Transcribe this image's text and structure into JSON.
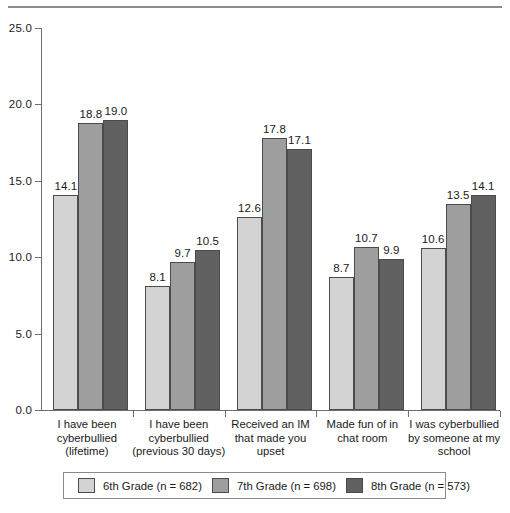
{
  "figure": {
    "top_rule": "horizontal-rule",
    "background_color": "#ffffff"
  },
  "chart_data": {
    "type": "bar",
    "title": "",
    "subtitle": "",
    "xlabel": "",
    "ylabel": "",
    "ylim": [
      0.0,
      25.0
    ],
    "ytick_labels": [
      "0.0",
      "5.0",
      "10.0",
      "15.0",
      "20.0",
      "25.0"
    ],
    "ytick_values": [
      0.0,
      5.0,
      10.0,
      15.0,
      20.0,
      25.0
    ],
    "grid": false,
    "legend_position": "bottom",
    "categories": [
      "I have been\ncyberbullied\n(lifetime)",
      "I have been\ncyberbullied\n(previous 30 days)",
      "Received an IM\nthat made you\nupset",
      "Made fun of in\nchat room",
      "I was cyberbullied\nby someone at my\nschool"
    ],
    "category_lines": [
      [
        "I have been",
        "cyberbullied",
        "(lifetime)"
      ],
      [
        "I have been",
        "cyberbullied",
        "(previous 30 days)"
      ],
      [
        "Received an IM",
        "that made you",
        "upset"
      ],
      [
        "Made fun of in",
        "chat room"
      ],
      [
        "I was cyberbullied",
        "by someone at my",
        "school"
      ]
    ],
    "series": [
      {
        "name": "6th Grade (n = 682)",
        "short_name": "6th Grade",
        "n": 682,
        "color": "#d3d3d3",
        "values": [
          14.1,
          8.1,
          12.6,
          8.7,
          10.6
        ],
        "labels": [
          "14.1",
          "8.1",
          "12.6",
          "8.7",
          "10.6"
        ]
      },
      {
        "name": "7th Grade (n = 698)",
        "short_name": "7th Grade",
        "n": 698,
        "color": "#9e9e9e",
        "values": [
          18.8,
          9.7,
          17.8,
          10.7,
          13.5
        ],
        "labels": [
          "18.8",
          "9.7",
          "17.8",
          "10.7",
          "13.5"
        ]
      },
      {
        "name": "8th Grade (n = 573)",
        "short_name": "8th Grade",
        "n": 573,
        "color": "#616161",
        "values": [
          19.0,
          10.5,
          17.1,
          9.9,
          14.1
        ],
        "labels": [
          "19.0",
          "10.5",
          "17.1",
          "9.9",
          "14.1"
        ]
      }
    ]
  },
  "legend": {
    "items": [
      {
        "label": "6th Grade (n = 682)",
        "color": "#d3d3d3"
      },
      {
        "label": "7th Grade (n = 698)",
        "color": "#9e9e9e"
      },
      {
        "label": "8th Grade (n = 573)",
        "color": "#616161"
      }
    ]
  }
}
